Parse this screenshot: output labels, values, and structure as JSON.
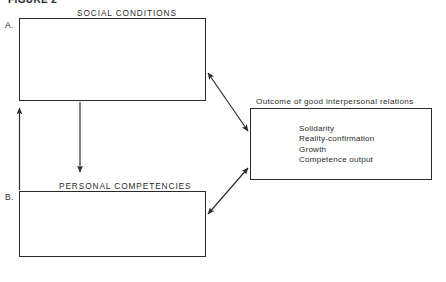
{
  "figure": {
    "caption": "FIGURE 2",
    "background_color": "#ffffff",
    "ink_color": "#2a2a2a"
  },
  "sections": {
    "a_letter": "A.",
    "b_letter": "B."
  },
  "boxes": [
    {
      "id": "box-a",
      "letter": "A.",
      "heading": "SOCIAL CONDITIONS",
      "body": ""
    },
    {
      "id": "box-b",
      "letter": "B.",
      "heading": "PERSONAL COMPETENCIES",
      "body": ""
    },
    {
      "id": "box-outcome",
      "letter": "",
      "heading": "Outcome of good interpersonal relations",
      "items": [
        "Solidarity",
        "Reality-confirmation",
        "Growth",
        "Competence output"
      ]
    }
  ],
  "outcome": {
    "heading": "Outcome of good interpersonal relations",
    "items": [
      "Solidarity",
      "Reality-confirmation",
      "Growth",
      "Competence output"
    ]
  },
  "arrows": [
    {
      "name": "social-conditions-to-outcome",
      "style": "double-headed",
      "from": "box-a bottom-right corner",
      "to": "outcome box left side upper"
    },
    {
      "name": "personal-competencies-to-outcome",
      "style": "double-headed",
      "from": "box-b top-right corner",
      "to": "outcome box left side lower"
    },
    {
      "name": "social-conditions-to-personal-competencies",
      "style": "single-headed-down",
      "from": "box-a bottom edge",
      "to": "above personal competencies heading"
    },
    {
      "name": "personal-competencies-to-social-conditions",
      "style": "single-headed-up",
      "from": "box-b left edge",
      "to": "box-a bottom-left corner"
    }
  ]
}
